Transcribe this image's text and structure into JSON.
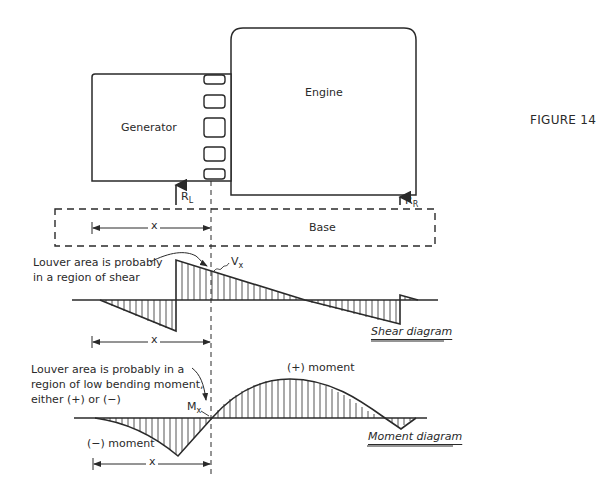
{
  "figure": {
    "label": "FIGURE 14"
  },
  "components": {
    "generator": {
      "label": "Generator"
    },
    "engine": {
      "label": "Engine"
    },
    "base": {
      "label": "Base"
    },
    "louver_count": 5
  },
  "reactions": {
    "left": {
      "symbol": "R",
      "subscript": "L"
    },
    "right": {
      "symbol": "R",
      "subscript": "R"
    }
  },
  "dimension": {
    "label": "x"
  },
  "shear": {
    "annotation_line1": "Louver area is probably",
    "annotation_line2": "in a region of shear",
    "point_symbol": "V",
    "point_subscript": "x",
    "caption": "Shear diagram"
  },
  "moment": {
    "annotation_line1": "Louver area is probably in a",
    "annotation_line2": "region of low bending moment,",
    "annotation_line3": "either (+) or (−)",
    "point_symbol": "M",
    "point_subscript": "x",
    "positive_label": "(+) moment",
    "negative_label": "(−) moment",
    "caption": "Moment diagram"
  },
  "colors": {
    "ink": "#2a2a2a",
    "background": "#ffffff"
  }
}
